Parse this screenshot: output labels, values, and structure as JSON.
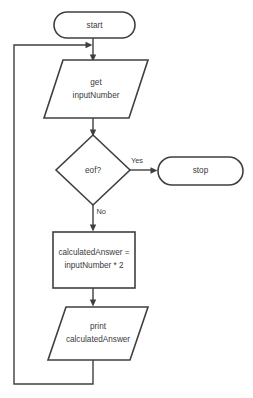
{
  "diagram": {
    "nodes": {
      "start": {
        "label": "start",
        "shape": "terminator"
      },
      "get_input": {
        "line1": "get",
        "line2": "inputNumber",
        "shape": "parallelogram-io"
      },
      "decision": {
        "label": "eof?",
        "shape": "diamond"
      },
      "stop": {
        "label": "stop",
        "shape": "terminator"
      },
      "process": {
        "line1": "calculatedAnswer =",
        "line2": "inputNumber * 2",
        "shape": "rectangle"
      },
      "print_output": {
        "line1": "print",
        "line2": "calculatedAnswer",
        "shape": "parallelogram-io"
      }
    },
    "edges": {
      "yes_label": "Yes",
      "no_label": "No"
    },
    "colors": {
      "stroke": "#3f3f3f",
      "fill": "#ffffff",
      "text": "#3a3a3a"
    }
  }
}
